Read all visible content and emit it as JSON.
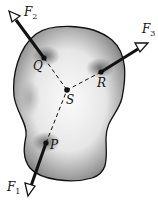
{
  "diagram": {
    "points": {
      "Q": {
        "label": "Q"
      },
      "R": {
        "label": "R"
      },
      "S": {
        "label": "S"
      },
      "P": {
        "label": "P"
      }
    },
    "forces": [
      {
        "label": "F",
        "sub": "1",
        "applied_at": "P"
      },
      {
        "label": "F",
        "sub": "2",
        "applied_at": "Q"
      },
      {
        "label": "F",
        "sub": "3",
        "applied_at": "R"
      }
    ],
    "colors": {
      "outline": "#111111",
      "shade_dark": "#6e6e6e",
      "shade_light": "#f4f4f4",
      "arrow": "#111111"
    }
  }
}
